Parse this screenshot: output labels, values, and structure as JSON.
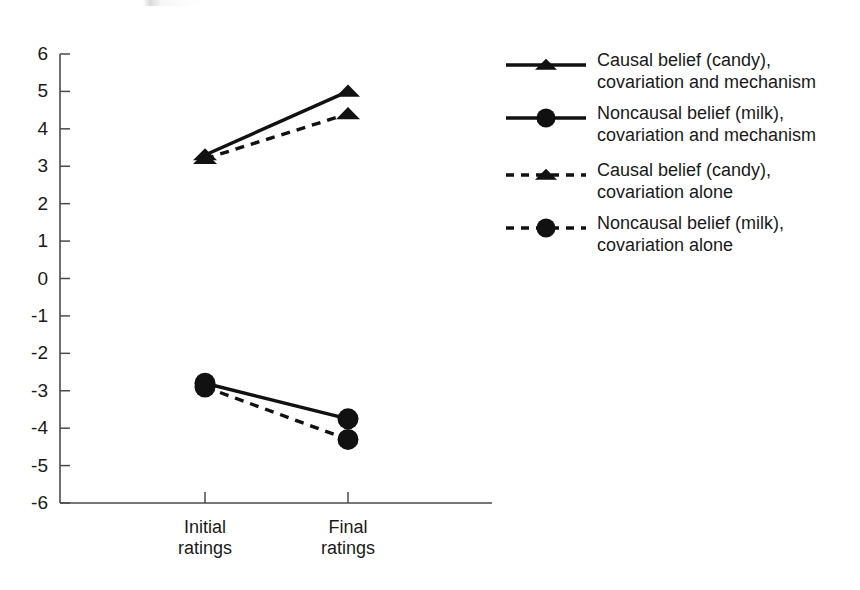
{
  "chart_data": {
    "type": "line",
    "title": "",
    "subtitle": "",
    "xlabel": "",
    "ylabel": "",
    "categories": [
      "Initial ratings",
      "Final ratings"
    ],
    "category_lines": [
      [
        "Initial",
        "ratings"
      ],
      [
        "Final",
        "ratings"
      ]
    ],
    "ylim": [
      -6,
      6
    ],
    "yticks": [
      6,
      5,
      4,
      3,
      2,
      1,
      0,
      -1,
      -2,
      -3,
      -4,
      -5,
      -6
    ],
    "ytick_labels": [
      "6",
      "5",
      "4",
      "3",
      "2",
      "1",
      "0",
      "-1",
      "-2",
      "-3",
      "-4",
      "-5",
      "-6"
    ],
    "grid": false,
    "legend_position": "right",
    "series": [
      {
        "name": "Causal belief (candy), covariation and mechanism",
        "name_lines": [
          "Causal belief (candy),",
          "covariation and mechanism"
        ],
        "marker": "triangle",
        "linestyle": "solid",
        "color": "#111111",
        "values": [
          3.3,
          5.0
        ]
      },
      {
        "name": "Noncausal belief (milk), covariation and mechanism",
        "name_lines": [
          "Noncausal belief (milk),",
          "covariation and mechanism"
        ],
        "marker": "circle",
        "linestyle": "solid",
        "color": "#111111",
        "values": [
          -2.8,
          -3.75
        ]
      },
      {
        "name": "Causal belief (candy), covariation alone",
        "name_lines": [
          "Causal belief (candy),",
          "covariation alone"
        ],
        "marker": "triangle",
        "linestyle": "dashed",
        "color": "#111111",
        "values": [
          3.2,
          4.4
        ]
      },
      {
        "name": "Noncausal belief (milk), covariation alone",
        "name_lines": [
          "Noncausal belief (milk),",
          "covariation alone"
        ],
        "marker": "circle",
        "linestyle": "dashed",
        "color": "#111111",
        "values": [
          -2.9,
          -4.3
        ]
      }
    ]
  },
  "axis": {
    "ytick_labels": [
      "6",
      "5",
      "4",
      "3",
      "2",
      "1",
      "0",
      "-1",
      "-2",
      "-3",
      "-4",
      "-5",
      "-6"
    ],
    "xtick_labels": [
      {
        "line1": "Initial",
        "line2": "ratings"
      },
      {
        "line1": "Final",
        "line2": "ratings"
      }
    ]
  },
  "legend": {
    "entries": [
      {
        "line1": "Causal belief (candy),",
        "line2": "covariation and mechanism",
        "marker": "triangle",
        "linestyle": "solid"
      },
      {
        "line1": "Noncausal belief (milk),",
        "line2": "covariation and mechanism",
        "marker": "circle",
        "linestyle": "solid"
      },
      {
        "line1": "Causal belief (candy),",
        "line2": "covariation alone",
        "marker": "triangle",
        "linestyle": "dashed"
      },
      {
        "line1": "Noncausal belief (milk),",
        "line2": "covariation alone",
        "marker": "circle",
        "linestyle": "dashed"
      }
    ]
  },
  "colors": {
    "ink": "#111111",
    "axis": "#4a4a4a",
    "background": "#ffffff"
  }
}
